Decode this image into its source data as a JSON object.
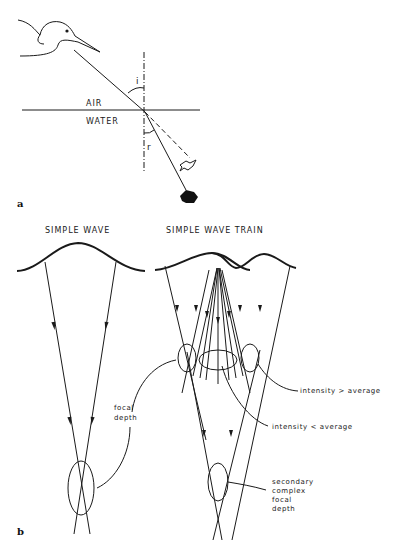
{
  "panel_a": {
    "label": "a",
    "angle_incidence": "i",
    "angle_refraction": "r",
    "medium_top": "AIR",
    "medium_bottom": "WATER",
    "icons": [
      "heron-icon",
      "apparent-fish-icon",
      "real-fish-icon"
    ]
  },
  "panel_b": {
    "label": "b",
    "left_title": "SIMPLE WAVE",
    "right_title": "SIMPLE WAVE TRAIN",
    "focal_depth_line1": "focal",
    "focal_depth_line2": "depth",
    "intensity_greater": "intensity > average",
    "intensity_less": "intensity < average",
    "secondary_line1": "secondary",
    "secondary_line2": "complex",
    "secondary_line3": "focal",
    "secondary_line4": "depth"
  }
}
